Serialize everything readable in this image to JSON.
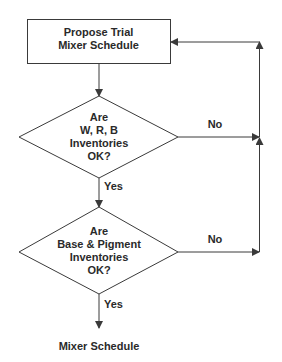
{
  "diagram": {
    "type": "flowchart",
    "start_box": {
      "lines": [
        "Propose Trial",
        "Mixer Schedule"
      ]
    },
    "decision_1": {
      "lines": [
        "Are",
        "W, R, B",
        "Inventories",
        "OK?"
      ],
      "yes_label": "Yes",
      "no_label": "No"
    },
    "decision_2": {
      "lines": [
        "Are",
        "Base & Pigment",
        "Inventories",
        "OK?"
      ],
      "yes_label": "Yes",
      "no_label": "No"
    },
    "output": {
      "label": "Mixer Schedule"
    },
    "colors": {
      "stroke": "#3a3a3a",
      "text": "#2a2a2a",
      "background": "#ffffff"
    }
  }
}
